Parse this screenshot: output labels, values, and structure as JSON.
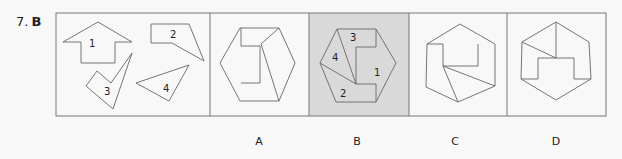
{
  "question": {
    "number": "7.",
    "answer": "B"
  },
  "colors": {
    "background": "#f8f8f8",
    "border": "#777777",
    "highlight_panel": "#d9d9d9",
    "stroke": "#666666"
  },
  "pieces_panel": {
    "pieces": [
      {
        "label": "1",
        "description": "arrow-house shape"
      },
      {
        "label": "2",
        "description": "quadrilateral with slanted edge"
      },
      {
        "label": "3",
        "description": "checkmark-like shape"
      },
      {
        "label": "4",
        "description": "triangle"
      }
    ]
  },
  "options": [
    {
      "label": "A",
      "highlighted": false
    },
    {
      "label": "B",
      "highlighted": true,
      "piece_labels": [
        "3",
        "4",
        "1",
        "2"
      ]
    },
    {
      "label": "C",
      "highlighted": false
    },
    {
      "label": "D",
      "highlighted": false
    }
  ]
}
